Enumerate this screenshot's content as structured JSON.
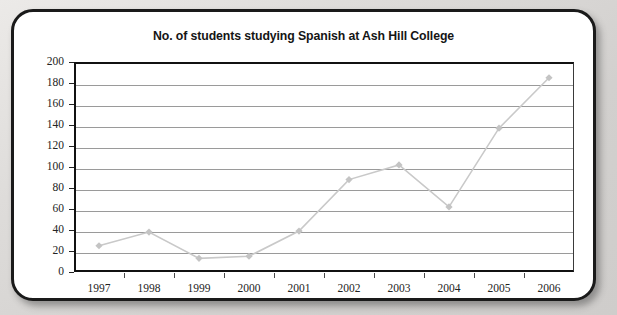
{
  "card": {
    "border_color": "#1a1a1a",
    "background": "#ffffff"
  },
  "page": {
    "background": "#d7d5d3"
  },
  "chart_data": {
    "type": "line",
    "title": "No. of students studying Spanish at Ash Hill College",
    "xlabel": "",
    "ylabel": "",
    "categories": [
      "1997",
      "1998",
      "1999",
      "2000",
      "2001",
      "2002",
      "2003",
      "2004",
      "2005",
      "2006"
    ],
    "values": [
      25,
      38,
      13,
      15,
      39,
      88,
      102,
      62,
      137,
      185
    ],
    "ylim": [
      0,
      200
    ],
    "ytick_step": 20,
    "yticks": [
      "200",
      "180",
      "160",
      "140",
      "120",
      "100",
      "80",
      "60",
      "40",
      "20",
      "0"
    ],
    "grid": true,
    "legend": false,
    "legend_position": "none",
    "series": [
      {
        "name": "No. of students studying Spanish",
        "values": [
          25,
          38,
          13,
          15,
          39,
          88,
          102,
          62,
          137,
          185
        ],
        "line_color": "#c9c9c9",
        "marker": "diamond",
        "marker_color": "#c4c4c4"
      }
    ]
  }
}
